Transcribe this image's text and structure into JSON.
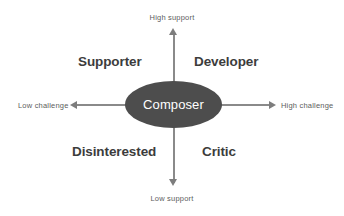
{
  "diagram": {
    "type": "2x2 quadrant matrix",
    "center": {
      "label": "Composer",
      "shape": "ellipse",
      "fill_color": "#4d4d4d",
      "text_color": "#ffffff"
    },
    "axes": {
      "vertical": {
        "top_label": "High support",
        "bottom_label": "Low support",
        "dimension": "support"
      },
      "horizontal": {
        "left_label": "Low challenge",
        "right_label": "High challenge",
        "dimension": "challenge"
      },
      "line_color": "#8a8a8a",
      "arrow_color": "#7d7d7d"
    },
    "quadrants": [
      {
        "position": "top-left",
        "label": "Supporter",
        "support": "high",
        "challenge": "low"
      },
      {
        "position": "top-right",
        "label": "Developer",
        "support": "high",
        "challenge": "high"
      },
      {
        "position": "bottom-left",
        "label": "Disinterested",
        "support": "low",
        "challenge": "low"
      },
      {
        "position": "bottom-right",
        "label": "Critic",
        "support": "low",
        "challenge": "high"
      }
    ],
    "label_color": "#3c3c3c",
    "axis_label_color": "#5d5d5d",
    "background_color": "#ffffff"
  }
}
